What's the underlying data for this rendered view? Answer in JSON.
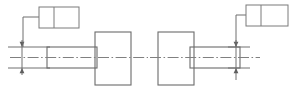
{
  "drawing": {
    "title": "Shaft and flange assembly - mirrored views with surface callouts",
    "canvas": {
      "width": 303,
      "height": 108,
      "background": "#ffffff"
    },
    "colors": {
      "outline": "#6b6b6b",
      "centerline": "#808080",
      "dimension": "#707070",
      "leader": "#6f6f6f",
      "callout_border": "#7a7a7a",
      "arrow_fill": "#5f5f5f",
      "background": "#ffffff"
    },
    "views": [
      {
        "name": "left-view",
        "description": "Shaft on left joined to flange block on right",
        "shaft": {
          "x": 47,
          "y": 47,
          "width": 50,
          "height": 21
        },
        "block": {
          "x": 95,
          "y": 32,
          "width": 36,
          "height": 53
        },
        "centerline": {
          "x1": 10,
          "y1": 57.5,
          "x2": 148,
          "y2": 57.5
        }
      },
      {
        "name": "right-view",
        "description": "Flange block on left joined to shaft extending right",
        "block": {
          "x": 158,
          "y": 32,
          "width": 36,
          "height": 53
        },
        "shaft": {
          "x": 190,
          "y": 47,
          "width": 50,
          "height": 21
        },
        "centerline": {
          "x1": 150,
          "y1": 57.5,
          "x2": 260,
          "y2": 57.5
        }
      }
    ],
    "dimensions": [
      {
        "name": "left-diameter-dimension",
        "orientation": "vertical",
        "line_x": 22,
        "top_y": 47,
        "bottom_y": 68,
        "label": "",
        "extension_lines": [
          {
            "x1": 8,
            "y1": 47,
            "x2": 50,
            "y2": 47
          },
          {
            "x1": 8,
            "y1": 68,
            "x2": 50,
            "y2": 68
          }
        ]
      },
      {
        "name": "right-diameter-dimension",
        "orientation": "vertical",
        "line_x": 236,
        "top_y": 47,
        "bottom_y": 68,
        "label": "",
        "extension_lines": [
          {
            "x1": 228,
            "y1": 47,
            "x2": 250,
            "y2": 47
          },
          {
            "x1": 228,
            "y1": 68,
            "x2": 250,
            "y2": 68
          }
        ]
      }
    ],
    "callouts": [
      {
        "name": "left-callout",
        "box": {
          "x": 39,
          "y": 7,
          "width": 40,
          "height": 21
        },
        "divider_x": 54,
        "cell_left_text": "",
        "cell_right_text": "",
        "leader_points": "39,17 23,17 23,47"
      },
      {
        "name": "right-callout",
        "box": {
          "x": 246,
          "y": 5,
          "width": 42,
          "height": 21
        },
        "divider_x": 261,
        "cell_left_text": "",
        "cell_right_text": "",
        "leader_points": "246,15 236,15 236,47"
      }
    ]
  }
}
